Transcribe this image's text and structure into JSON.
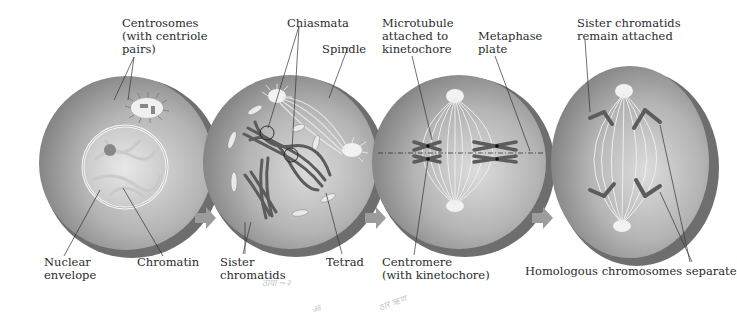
{
  "diagram": {
    "type": "process",
    "colors": {
      "cell_fill": "#9a9a9a",
      "cell_highlight": "#d8d8d8",
      "cell_edge": "#6a6a6a",
      "chromosome": "#5a5a5a",
      "arrow": "#9c9c9c",
      "leader_line": "#333333",
      "text": "#2b2b2b"
    },
    "stages": [
      {
        "id": "stage-1",
        "description": "Cell with nucleus, centrosomes and chromatin",
        "labels": {
          "centrosomes": "Centrosomes\n(with centriole\npairs)",
          "nuclear_envelope": "Nuclear\nenvelope",
          "chromatin": "Chromatin"
        }
      },
      {
        "id": "stage-2",
        "description": "Tetrads forming with chiasmata and spindle",
        "labels": {
          "chiasmata": "Chiasmata",
          "spindle": "Spindle",
          "sister_chromatids": "Sister\nchromatids",
          "tetrad": "Tetrad"
        }
      },
      {
        "id": "stage-3",
        "description": "Tetrads aligned at metaphase plate",
        "labels": {
          "microtubule": "Microtubule\nattached to\nkinetochore",
          "metaphase_plate": "Metaphase\nplate",
          "centromere": "Centromere\n(with kinetochore)"
        }
      },
      {
        "id": "stage-4",
        "description": "Homologous chromosomes moving to poles",
        "labels": {
          "sister_remain": "Sister chromatids\nremain attached",
          "homologous_separate": "Homologous chromosomes separate"
        }
      }
    ],
    "arrows": [
      {
        "from": "stage-1",
        "to": "stage-2"
      },
      {
        "from": "stage-2",
        "to": "stage-3"
      },
      {
        "from": "stage-3",
        "to": "stage-4"
      }
    ],
    "handwriting": [
      "ठाया ~२",
      "ॐ",
      "ठार ऋण"
    ]
  }
}
